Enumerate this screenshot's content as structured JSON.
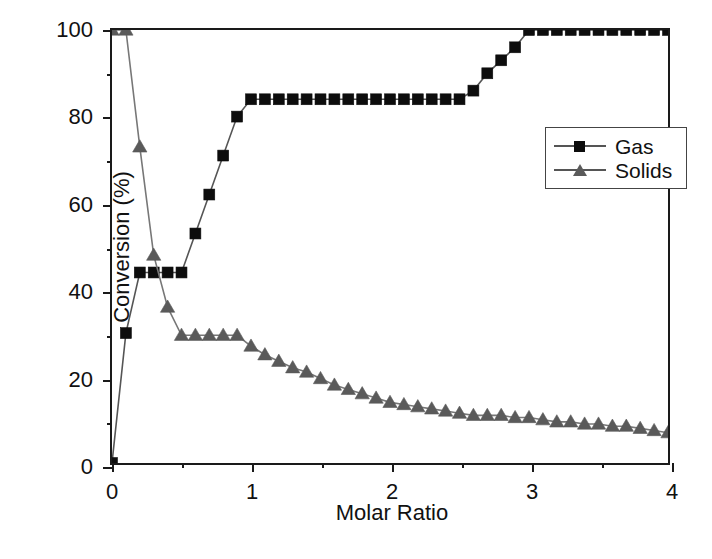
{
  "figure": {
    "background": "#ffffff",
    "frame_color": "#1a1a1a"
  },
  "axes": {
    "x_title": "Molar Ratio",
    "y_title": "Conversion (%)",
    "x_ticks": [
      "0",
      "1",
      "2",
      "3",
      "4"
    ],
    "y_ticks": [
      "0",
      "20",
      "40",
      "60",
      "80",
      "100"
    ],
    "x_minor_step": 0.5,
    "y_minor_step": 10
  },
  "legend": {
    "position": "right-upper",
    "entries": [
      {
        "label": "Gas",
        "marker": "square",
        "color": "#0d0d0d"
      },
      {
        "label": "Solids",
        "marker": "triangle",
        "color": "#5a5a5a"
      }
    ]
  },
  "chart_data": {
    "type": "line",
    "title": "",
    "xlabel": "Molar Ratio",
    "ylabel": "Conversion (%)",
    "xlim": [
      0,
      4
    ],
    "ylim": [
      0,
      100
    ],
    "grid": false,
    "legend_position": "right-upper",
    "series": [
      {
        "name": "Gas",
        "marker": "square",
        "color": "#0d0d0d",
        "line_color": "#555555",
        "x": [
          0.0,
          0.1,
          0.2,
          0.3,
          0.4,
          0.5,
          0.6,
          0.7,
          0.8,
          0.9,
          1.0,
          1.1,
          1.2,
          1.3,
          1.4,
          1.5,
          1.6,
          1.7,
          1.8,
          1.9,
          2.0,
          2.1,
          2.2,
          2.3,
          2.4,
          2.5,
          2.6,
          2.7,
          2.8,
          2.9,
          3.0,
          3.1,
          3.2,
          3.3,
          3.4,
          3.5,
          3.6,
          3.7,
          3.8,
          3.9,
          4.0
        ],
        "y": [
          0,
          30,
          44,
          44,
          44,
          44,
          53,
          62,
          71,
          80,
          84,
          84,
          84,
          84,
          84,
          84,
          84,
          84,
          84,
          84,
          84,
          84,
          84,
          84,
          84,
          84,
          86,
          90,
          93,
          96,
          100,
          100,
          100,
          100,
          100,
          100,
          100,
          100,
          100,
          100,
          100
        ]
      },
      {
        "name": "Solids",
        "marker": "triangle",
        "color": "#5a5a5a",
        "line_color": "#777777",
        "x": [
          0.0,
          0.1,
          0.2,
          0.3,
          0.4,
          0.5,
          0.6,
          0.7,
          0.8,
          0.9,
          1.0,
          1.1,
          1.2,
          1.3,
          1.4,
          1.5,
          1.6,
          1.7,
          1.8,
          1.9,
          2.0,
          2.1,
          2.2,
          2.3,
          2.4,
          2.5,
          2.6,
          2.7,
          2.8,
          2.9,
          3.0,
          3.1,
          3.2,
          3.3,
          3.4,
          3.5,
          3.6,
          3.7,
          3.8,
          3.9,
          4.0
        ],
        "y": [
          100,
          100,
          73,
          48,
          36,
          29.5,
          29.5,
          29.5,
          29.5,
          29.5,
          27,
          25,
          23.5,
          22,
          21,
          19.5,
          18,
          17,
          16,
          15,
          14,
          13.5,
          13,
          12.5,
          12,
          11.5,
          11,
          11,
          11,
          10.5,
          10.5,
          10,
          9.5,
          9.5,
          9,
          9,
          8.5,
          8.5,
          8,
          7.5,
          7
        ]
      }
    ]
  },
  "caption": {
    "text": ""
  }
}
